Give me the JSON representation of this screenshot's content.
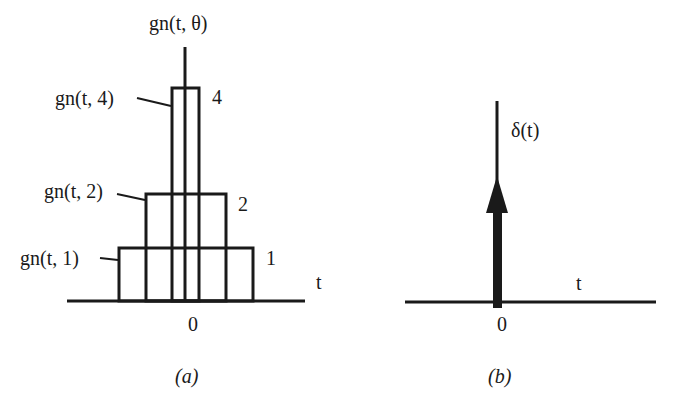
{
  "panel_a": {
    "y_axis_label": "gn(t, θ)",
    "x_axis_label": "t",
    "origin_label": "0",
    "caption": "(a)",
    "pulses": [
      {
        "name": "gn(t, 1)",
        "height_label": "1"
      },
      {
        "name": "gn(t, 2)",
        "height_label": "2"
      },
      {
        "name": "gn(t, 4)",
        "height_label": "4"
      }
    ]
  },
  "panel_b": {
    "y_axis_label": "δ(t)",
    "x_axis_label": "t",
    "origin_label": "0",
    "caption": "(b)"
  },
  "colors": {
    "stroke": "#1a1a1a",
    "background": "#ffffff"
  }
}
